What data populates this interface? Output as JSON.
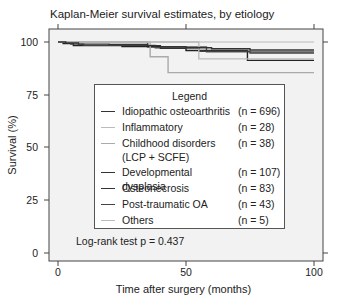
{
  "chart_data": {
    "type": "line",
    "title": "Kaplan-Meier survival estimates, by etiology",
    "xlabel": "Time after surgery (months)",
    "ylabel": "Survival (%)",
    "xlim": [
      0,
      100
    ],
    "ylim": [
      0,
      100
    ],
    "xticks": [
      "0",
      "50",
      "100"
    ],
    "yticks": [
      "0",
      "25",
      "50",
      "75",
      "100"
    ],
    "grid": false,
    "legend_title": "Legend",
    "legend_position": "inside-center",
    "annotation": "Log-rank test p = 0.437",
    "series": [
      {
        "name": "Idiopathic osteoarthritis",
        "n": "(n = 696)",
        "color": "#333333",
        "x": [
          0,
          3,
          8,
          20,
          35,
          40,
          50,
          60,
          75,
          100
        ],
        "y": [
          100,
          99.5,
          99,
          98.8,
          98.3,
          97.8,
          97.3,
          96.8,
          96.2,
          96.2
        ]
      },
      {
        "name": "Inflammatory",
        "n": "(n = 28)",
        "color": "#bbbbbb",
        "x": [
          0,
          55,
          100
        ],
        "y": [
          100,
          92,
          92
        ]
      },
      {
        "name": "Childhood disorders (LCP + SCFE)",
        "n": "(n = 38)",
        "color": "#aaaaaa",
        "x": [
          0,
          36,
          43,
          100
        ],
        "y": [
          100,
          93,
          85.5,
          85.5
        ]
      },
      {
        "name": "Developmental dysplasia",
        "n": "(n = 107)",
        "color": "#444444",
        "x": [
          0,
          5,
          10,
          38,
          55,
          75,
          100
        ],
        "y": [
          100,
          99,
          98.4,
          97.2,
          95.6,
          94.8,
          94.8
        ]
      },
      {
        "name": "Osteonecrosis",
        "n": "(n = 83)",
        "color": "#222222",
        "x": [
          0,
          2,
          6,
          25,
          40,
          50,
          74,
          100
        ],
        "y": [
          100,
          99.3,
          98.3,
          97.8,
          97,
          96,
          91.3,
          91.3
        ]
      },
      {
        "name": "Post-traumatic OA",
        "n": "(n = 43)",
        "color": "#555555",
        "x": [
          0,
          35,
          58,
          100
        ],
        "y": [
          100,
          97.6,
          95.3,
          95.3
        ]
      },
      {
        "name": "Others",
        "n": "(n = 5)",
        "color": "#cccccc",
        "x": [
          0,
          100
        ],
        "y": [
          100,
          100
        ]
      }
    ]
  },
  "legend": {
    "title": "Legend",
    "items": [
      {
        "label": "Idiopathic osteoarthritis",
        "n": "(n = 696)",
        "color": "#333333"
      },
      {
        "label": "Inflammatory",
        "n": "(n = 28)",
        "color": "#bbbbbb"
      },
      {
        "label": "Childhood disorders\n(LCP + SCFE)",
        "n": "(n = 38)",
        "color": "#aaaaaa"
      },
      {
        "label": "Developmental dysplasia",
        "n": "(n = 107)",
        "color": "#333333"
      },
      {
        "label": "Osteonecrosis",
        "n": "(n = 83)",
        "color": "#333333"
      },
      {
        "label": "Post-traumatic OA",
        "n": "(n = 43)",
        "color": "#444444"
      },
      {
        "label": "Others",
        "n": "(n = 5)",
        "color": "#bbbbbb"
      }
    ]
  },
  "labels": {
    "title": "Kaplan-Meier survival estimates, by etiology",
    "xlabel": "Time after surgery (months)",
    "ylabel": "Survival (%)",
    "logrank": "Log-rank test p = 0.437",
    "yticks": [
      "100",
      "75",
      "50",
      "25",
      "0"
    ],
    "xticks": [
      "0",
      "50",
      "100"
    ]
  }
}
